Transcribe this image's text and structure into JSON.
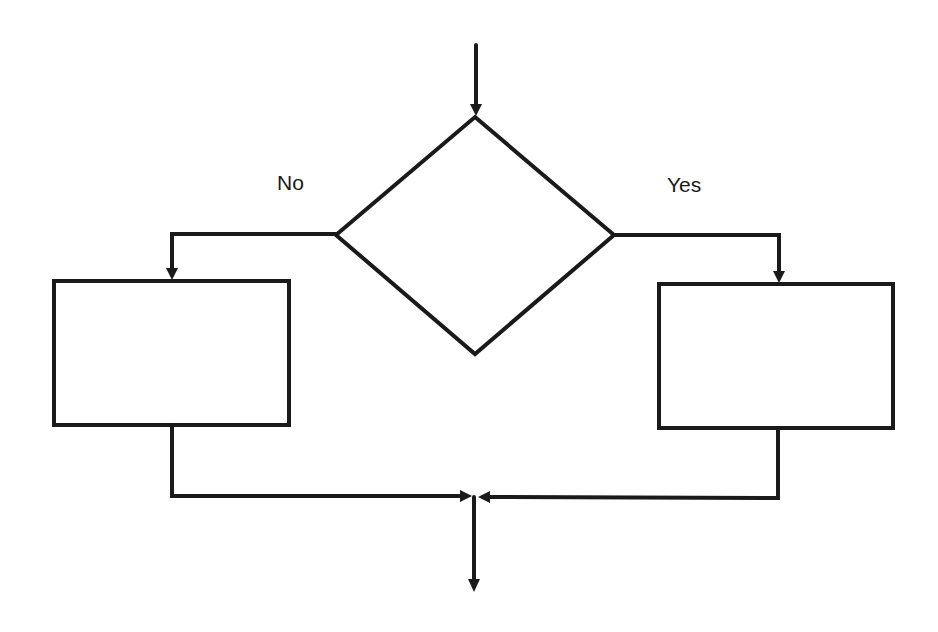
{
  "diagram": {
    "type": "flowchart-decision",
    "labels": {
      "no_branch": "No",
      "yes_branch": "Yes"
    },
    "nodes": [
      {
        "id": "decision",
        "shape": "diamond",
        "text": ""
      },
      {
        "id": "no_process",
        "shape": "rectangle",
        "text": ""
      },
      {
        "id": "yes_process",
        "shape": "rectangle",
        "text": ""
      }
    ],
    "edges": [
      {
        "from": "entry",
        "to": "decision",
        "label": ""
      },
      {
        "from": "decision",
        "to": "no_process",
        "label": "No"
      },
      {
        "from": "decision",
        "to": "yes_process",
        "label": "Yes"
      },
      {
        "from": "no_process",
        "to": "merge",
        "label": ""
      },
      {
        "from": "yes_process",
        "to": "merge",
        "label": ""
      },
      {
        "from": "merge",
        "to": "exit",
        "label": ""
      }
    ],
    "colors": {
      "stroke": "#1a1a1a",
      "background": "#ffffff"
    }
  }
}
